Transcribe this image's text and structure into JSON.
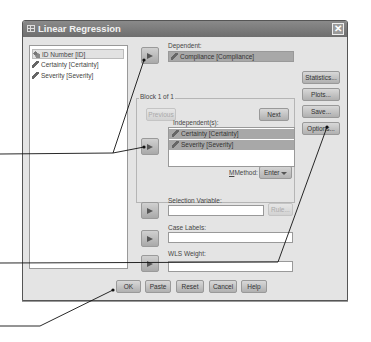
{
  "window": {
    "title": "Linear Regression",
    "icon": "grid-icon",
    "close_icon": "close-icon"
  },
  "source_list": {
    "items": [
      {
        "label": "ID Number [ID]",
        "icon": "nominal-variable-icon",
        "selected": true
      },
      {
        "label": "Certainty [Certainty]",
        "icon": "scale-variable-icon",
        "selected": false
      },
      {
        "label": "Severity [Severity]",
        "icon": "scale-variable-icon",
        "selected": false
      }
    ]
  },
  "dependent": {
    "label": "Dependent:",
    "value": "Compliance [Compliance]",
    "icon": "scale-variable-icon"
  },
  "block": {
    "title": "Block 1 of 1",
    "previous_label": "Previous",
    "next_label": "Next"
  },
  "independents": {
    "label": "Independent(s):",
    "items": [
      {
        "label": "Certainty [Certainty]",
        "icon": "scale-variable-icon"
      },
      {
        "label": "Severity [Severity]",
        "icon": "scale-variable-icon"
      }
    ]
  },
  "method": {
    "label": "Method:",
    "value": "Enter"
  },
  "selection_variable": {
    "label": "Selection Variable:",
    "value": "",
    "rule_label": "Rule..."
  },
  "case_labels": {
    "label": "Case Labels:",
    "value": ""
  },
  "wls_weight": {
    "label": "WLS Weight:",
    "value": ""
  },
  "side_buttons": {
    "statistics": "Statistics...",
    "plots": "Plots...",
    "save": "Save...",
    "options": "Options..."
  },
  "bottom_buttons": {
    "ok": "OK",
    "paste": "Paste",
    "reset": "Reset",
    "cancel": "Cancel",
    "help": "Help"
  },
  "colors": {
    "titlebar": "#7a7a7a",
    "dialog_bg": "#e4e4e4",
    "selected_field": "#a8a8a8",
    "callout_line": "#111111"
  }
}
